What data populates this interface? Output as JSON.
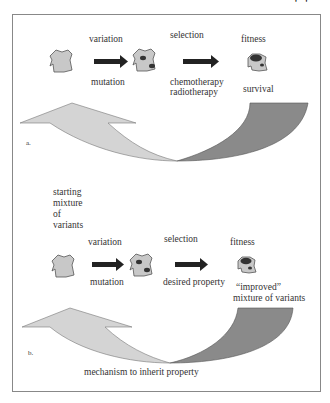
{
  "header_fragment": "' '",
  "panel_a": {
    "tag": "a.",
    "steps": [
      {
        "top": "variation",
        "bottom": "mutation"
      },
      {
        "top": "selection",
        "bottom_lines": [
          "chemotherapy",
          "radiotherapy"
        ]
      },
      {
        "top": "fitness",
        "bottom": "survival"
      }
    ]
  },
  "panel_b": {
    "tag": "b.",
    "start_label_lines": [
      "starting",
      "mixture",
      "of",
      "variants"
    ],
    "steps": [
      {
        "top": "variation",
        "bottom": "mutation"
      },
      {
        "top": "selection",
        "bottom": "desired property"
      },
      {
        "top": "fitness",
        "bottom_lines": [
          "“improved”",
          "mixture of variants"
        ]
      }
    ],
    "feedback_label": "mechanism to inherit property"
  },
  "colors": {
    "cell_fill": "#c8c8c8",
    "cell_stroke": "#555555",
    "nucleus": "#333333",
    "arrow": "#222222",
    "loop_light": "#d4d4d4",
    "loop_dark": "#8a8a8a",
    "frame": "#888888"
  }
}
